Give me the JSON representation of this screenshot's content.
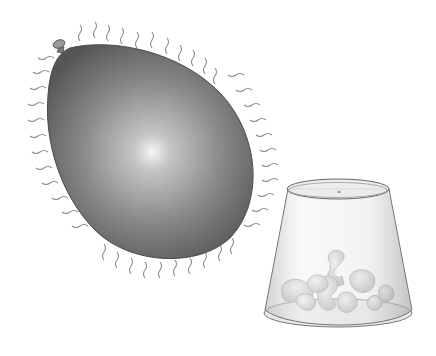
{
  "scene": {
    "description": "Illustration of a statically charged balloon next to an inverted clear plastic cup containing foam packing peanuts",
    "background": "#ffffff",
    "balloon": {
      "label": "charged balloon",
      "fill_dark": "#5a5a5a",
      "fill_light": "#f2f2f2",
      "charge_lines": "wavy lines radiating around edge"
    },
    "cup": {
      "label": "inverted clear plastic cup",
      "stroke": "#7a7a7a",
      "contents": "foam packing peanuts"
    }
  }
}
